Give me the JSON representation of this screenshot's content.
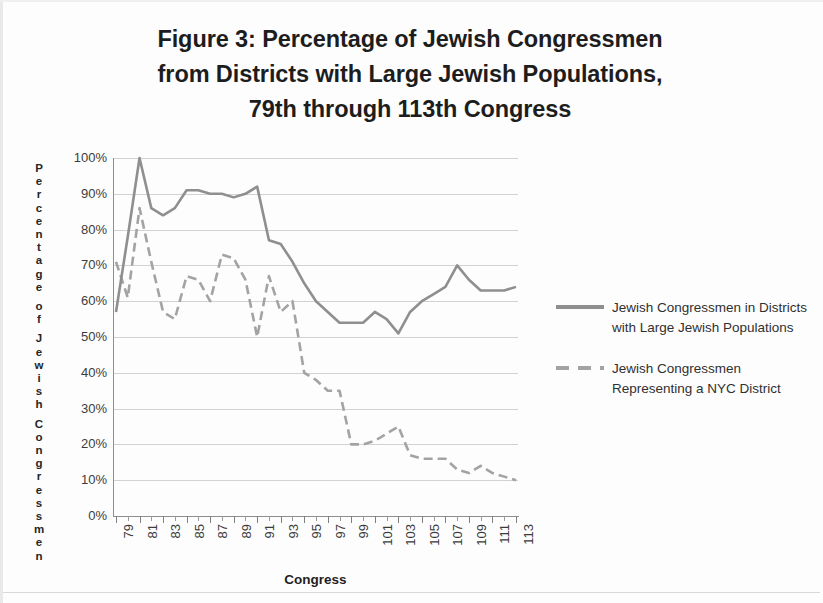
{
  "title": {
    "line1": "Figure 3:  Percentage of Jewish Congressmen",
    "line2": "from Districts with Large Jewish Populations,",
    "line3": "79th through 113th Congress"
  },
  "legend": {
    "items": [
      {
        "label": "Jewish Congressmen in Districts with Large Jewish Populations",
        "style": "solid",
        "color": "#8f8f8f"
      },
      {
        "label": "Jewish Congressmen Representing a NYC District",
        "style": "dashed",
        "color": "#a3a3a3"
      }
    ]
  },
  "axes": {
    "y_title": "Percentage of Jewish Congressmen",
    "x_title": "Congress",
    "y_ticks": [
      "100%",
      "90%",
      "80%",
      "70%",
      "60%",
      "50%",
      "40%",
      "30%",
      "20%",
      "10%",
      "0%"
    ],
    "x_ticks": [
      "79",
      "81",
      "83",
      "85",
      "87",
      "89",
      "91",
      "93",
      "95",
      "97",
      "99",
      "101",
      "103",
      "105",
      "107",
      "109",
      "111",
      "113"
    ]
  },
  "chart_data": {
    "type": "line",
    "title": "Figure 3:  Percentage of Jewish Congressmen from Districts with Large Jewish Populations, 79th through 113th Congress",
    "xlabel": "Congress",
    "ylabel": "Percentage of Jewish Congressmen",
    "ylim": [
      0,
      100
    ],
    "xlim": [
      79,
      113
    ],
    "grid": true,
    "legend_position": "right",
    "x": [
      79,
      80,
      81,
      82,
      83,
      84,
      85,
      86,
      87,
      88,
      89,
      90,
      91,
      92,
      93,
      94,
      95,
      96,
      97,
      98,
      99,
      100,
      101,
      102,
      103,
      104,
      105,
      106,
      107,
      108,
      109,
      110,
      111,
      112,
      113
    ],
    "series": [
      {
        "name": "Jewish Congressmen in Districts with Large Jewish Populations",
        "style": "solid",
        "color": "#8f8f8f",
        "values": [
          57,
          78,
          100,
          86,
          84,
          86,
          91,
          91,
          90,
          90,
          89,
          90,
          92,
          77,
          76,
          71,
          65,
          60,
          57,
          54,
          54,
          54,
          57,
          55,
          51,
          57,
          60,
          62,
          64,
          70,
          66,
          63,
          63,
          63,
          64
        ]
      },
      {
        "name": "Jewish Congressmen Representing a NYC District",
        "style": "dashed",
        "color": "#a3a3a3",
        "values": [
          71,
          61,
          86,
          71,
          57,
          55,
          67,
          66,
          60,
          73,
          72,
          66,
          66,
          62,
          67,
          57,
          60,
          50,
          54,
          60,
          67,
          61,
          58,
          55,
          51,
          40,
          38,
          36,
          35,
          30,
          20,
          20,
          21,
          22,
          25
        ]
      }
    ],
    "series_tail_note": {
      "solid_last": 64,
      "dashed_last": 10
    }
  },
  "nyc_series_full": {
    "name": "Jewish Congressmen Representing a NYC District",
    "x": [
      79,
      80,
      81,
      82,
      83,
      84,
      85,
      86,
      87,
      88,
      89,
      90,
      91,
      92,
      93,
      94,
      95,
      96,
      97,
      98,
      99,
      100,
      101,
      102,
      103,
      104,
      105,
      106,
      107,
      108,
      109,
      110,
      111,
      112,
      113
    ],
    "values": [
      71,
      61,
      86,
      71,
      57,
      55,
      67,
      66,
      60,
      73,
      72,
      66,
      50,
      67,
      57,
      60,
      40,
      38,
      35,
      35,
      20,
      20,
      21,
      23,
      25,
      17,
      16,
      16,
      16,
      13,
      12,
      14,
      12,
      11,
      10
    ]
  }
}
